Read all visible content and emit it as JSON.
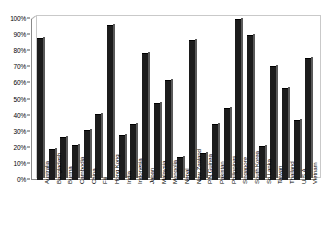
{
  "chart_data": {
    "type": "bar",
    "title": "",
    "xlabel": "",
    "ylabel": "",
    "ylim": [
      0,
      100
    ],
    "grid": false,
    "legend": "none",
    "y_ticks": [
      "0%",
      "10%",
      "20%",
      "30%",
      "40%",
      "50%",
      "60%",
      "70%",
      "80%",
      "90%",
      "100%"
    ],
    "y_tick_values": [
      0,
      10,
      20,
      30,
      40,
      50,
      60,
      70,
      80,
      90,
      100
    ],
    "categories": [
      "Australia",
      "Bangladesh",
      "Burma",
      "Cambodia",
      "China",
      "Fiji",
      "Hong Kong",
      "India",
      "Indonesia",
      "Japan",
      "Malaysia",
      "Mongolia",
      "Nepal",
      "New Zealand",
      "P.N.Guinea",
      "Pakistan",
      "Philippines",
      "Singapore",
      "South Korea",
      "Sri Lanka",
      "Taiwan",
      "Thailand",
      "U.S.A",
      "Vietnam"
    ],
    "values": [
      88,
      19,
      27,
      22,
      31,
      41,
      96,
      28,
      35,
      79,
      48,
      62,
      14,
      87,
      17,
      35,
      45,
      100,
      90,
      21,
      71,
      57,
      37,
      76
    ],
    "bar_color": "#1c1c1c",
    "axis_color": "#8a8a8a",
    "frame_color": "#c9c9c9"
  }
}
